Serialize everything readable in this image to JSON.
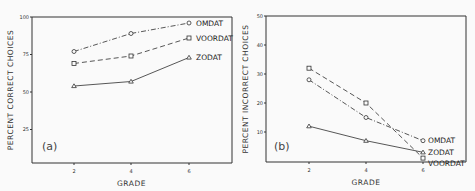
{
  "chart_data": [
    {
      "type": "line",
      "panel_label": "(a)",
      "title": "",
      "xlabel": "GRADE",
      "ylabel": "PERCENT CORRECT CHOICES",
      "x": [
        2,
        4,
        6
      ],
      "x_ticks": [
        "2",
        "4",
        "6"
      ],
      "y_ticks": [
        "25",
        "50",
        "75",
        "100"
      ],
      "ylim": [
        0,
        100
      ],
      "grid": false,
      "legend_position": "inline-right",
      "series": [
        {
          "name": "OMDAT",
          "marker": "circle",
          "line": "dash-dot",
          "values": [
            77,
            89,
            96
          ]
        },
        {
          "name": "VOORDAT",
          "marker": "square",
          "line": "dashed",
          "values": [
            69,
            74,
            86
          ]
        },
        {
          "name": "ZODAT",
          "marker": "triangle",
          "line": "solid",
          "values": [
            54,
            57,
            73
          ]
        }
      ]
    },
    {
      "type": "line",
      "panel_label": "(b)",
      "title": "",
      "xlabel": "GRADE",
      "ylabel": "PERCENT INCORRECT CHOICES",
      "x": [
        2,
        4,
        6
      ],
      "x_ticks": [
        "2",
        "4",
        "6"
      ],
      "y_ticks": [
        "10",
        "20",
        "30",
        "40",
        "50"
      ],
      "ylim": [
        0,
        50
      ],
      "grid": false,
      "legend_position": "inline-right",
      "series": [
        {
          "name": "OMDAT",
          "marker": "circle",
          "line": "dash-dot",
          "values": [
            28,
            15,
            7
          ]
        },
        {
          "name": "VOORDAT",
          "marker": "square",
          "line": "dashed",
          "values": [
            32,
            20,
            1
          ]
        },
        {
          "name": "ZODAT",
          "marker": "triangle",
          "line": "solid",
          "values": [
            12,
            7,
            3
          ]
        }
      ]
    }
  ]
}
